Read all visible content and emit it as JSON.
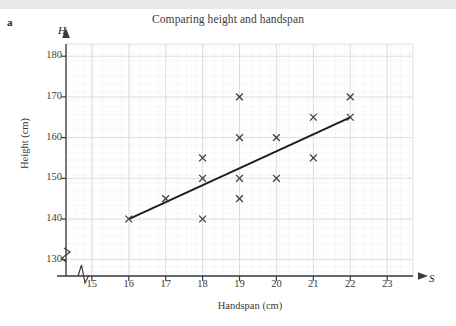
{
  "part_label": "a",
  "title": "Comparing height and handspan",
  "axis_vars": {
    "y": "H",
    "x": "S"
  },
  "chart_data": {
    "type": "scatter",
    "title": "Comparing height and handspan",
    "xlabel": "Handspan (cm)",
    "ylabel": "Height (cm)",
    "xlim": [
      14.3,
      23.7
    ],
    "ylim": [
      126,
      183
    ],
    "xticks": [
      15,
      16,
      17,
      18,
      19,
      20,
      21,
      22,
      23
    ],
    "yticks": [
      130,
      140,
      150,
      160,
      170,
      180
    ],
    "grid": true,
    "axis_break_x": true,
    "axis_break_y": true,
    "marker": "x",
    "marker_color": "#3c3c46",
    "points": [
      {
        "x": 16,
        "y": 140
      },
      {
        "x": 17,
        "y": 145
      },
      {
        "x": 18,
        "y": 155
      },
      {
        "x": 18,
        "y": 150
      },
      {
        "x": 18,
        "y": 140
      },
      {
        "x": 19,
        "y": 170
      },
      {
        "x": 19,
        "y": 160
      },
      {
        "x": 19,
        "y": 150
      },
      {
        "x": 19,
        "y": 145
      },
      {
        "x": 20,
        "y": 160
      },
      {
        "x": 20,
        "y": 150
      },
      {
        "x": 21,
        "y": 165
      },
      {
        "x": 21,
        "y": 155
      },
      {
        "x": 22,
        "y": 170
      },
      {
        "x": 22,
        "y": 165
      }
    ],
    "trend_line": {
      "name": "line of best fit",
      "from": {
        "x": 16,
        "y": 140
      },
      "to": {
        "x": 22,
        "y": 165
      },
      "color": "#1c1c1c"
    },
    "colors": {
      "grid_minor": "#e9e9ef",
      "grid_major": "#d6d6de",
      "axis": "#3a3a3c",
      "text": "#3a3a3c"
    }
  }
}
